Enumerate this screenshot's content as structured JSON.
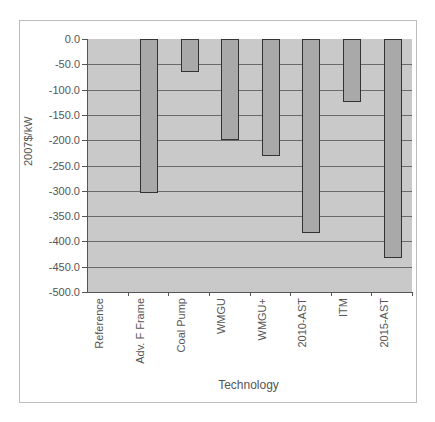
{
  "chart_data": {
    "type": "bar",
    "title": "",
    "xlabel": "Technology",
    "ylabel": "2007$/kW",
    "categories": [
      "Reference",
      "Adv. F Frame",
      "Coal Pump",
      "WMGU",
      "WMGU+",
      "2010-AST",
      "ITM",
      "2015-AST"
    ],
    "values": [
      0,
      -305,
      -66,
      -200,
      -232,
      -383,
      -124,
      -432
    ],
    "ylim": [
      -500,
      0
    ],
    "yticks": [
      "0.0",
      "-50.0",
      "-100.0",
      "-150.0",
      "-200.0",
      "-250.0",
      "-300.0",
      "-350.0",
      "-400.0",
      "-450.0",
      "-500.0"
    ],
    "grid": true,
    "legend": null
  },
  "colors": {
    "plot_background": "#c9c9c9",
    "bar_fill": "#a9a9a9",
    "bar_border": "#333333",
    "gridline": "#6a6a6a"
  }
}
